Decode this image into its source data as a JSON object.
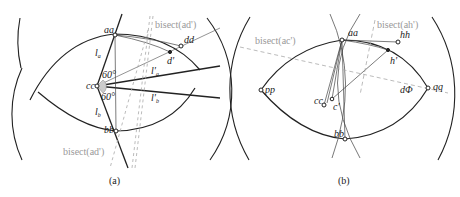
{
  "panels": [
    {
      "id": "a",
      "caption": "(a)",
      "labels": {
        "aa": "aa",
        "dd": "dd",
        "d_prime": "d'",
        "cc": "cc",
        "bb": "bb",
        "la": "l",
        "la_sub": "a",
        "lb": "l",
        "lb_sub": "b",
        "lpa": "l'",
        "lpa_sub": "a",
        "lpb": "l'",
        "lpb_sub": "b",
        "angle_top": "60°",
        "angle_bottom": "60°",
        "bisect_top": "bisect(ad')",
        "bisect_bottom": "bisect(ad')"
      }
    },
    {
      "id": "b",
      "caption": "(b)",
      "labels": {
        "aa": "aa",
        "hh": "hh",
        "h_prime": "h'",
        "pp": "pp",
        "qq": "qq",
        "dd": "dΦ",
        "cc": "cc",
        "c_prime": "c'",
        "bb": "bb",
        "bisect_ah": "bisect(ah')",
        "bisect_ac": "bisect(ac')"
      }
    }
  ],
  "colors": {
    "ink": "#222222",
    "guide": "#999999"
  }
}
